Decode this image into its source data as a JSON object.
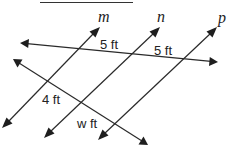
{
  "diagram": {
    "type": "parallel-lines-and-transversals",
    "answer_blank": "",
    "parallel_lines": [
      {
        "name": "m",
        "label": "m"
      },
      {
        "name": "n",
        "label": "n"
      },
      {
        "name": "p",
        "label": "p"
      }
    ],
    "transversals": [
      {
        "name": "top-transversal",
        "segments": [
          "5 ft",
          "5 ft"
        ]
      },
      {
        "name": "bottom-transversal",
        "segments": [
          "4 ft",
          "w ft"
        ]
      }
    ],
    "labels": {
      "top_left_segment": "5 ft",
      "top_right_segment": "5 ft",
      "bottom_left_segment": "4 ft",
      "bottom_right_segment": "w ft"
    },
    "colors": {
      "line": "#2a2a2a",
      "text": "#222222",
      "background": "#ffffff"
    }
  }
}
